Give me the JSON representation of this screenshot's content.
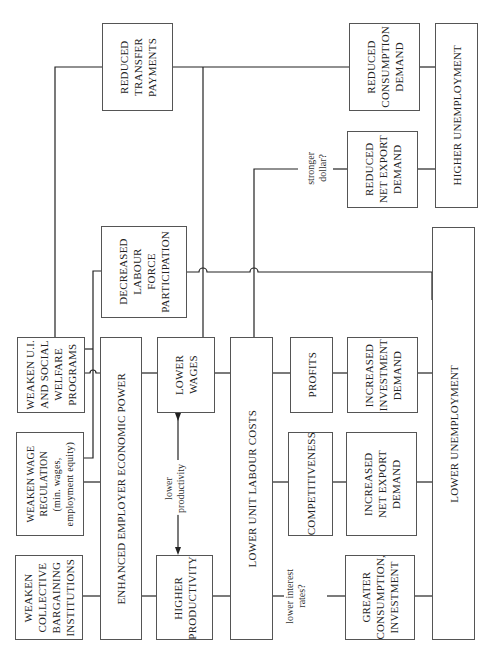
{
  "diagram": {
    "orientation": "rotated-90-ccw",
    "nodes": {
      "weaken_ui": {
        "label": "WEAKEN U.I.\nAND SOCIAL\nWELFARE\nPROGRAMS"
      },
      "weaken_wage_reg": {
        "label": "WEAKEN WAGE\nREGULATION\n(min. wages,\nemployment equity)"
      },
      "weaken_collective": {
        "label": "WEAKEN\nCOLLECTIVE\nBARGAINING\nINSTITUTIONS"
      },
      "enhanced_employer": {
        "label": "ENHANCED EMPLOYER ECONOMIC POWER"
      },
      "lower_wages": {
        "label": "LOWER\nWAGES"
      },
      "higher_productivity": {
        "label": "HIGHER\nPRODUCTIVITY"
      },
      "lower_unit_labour": {
        "label": "LOWER UNIT LABOUR COSTS"
      },
      "profits": {
        "label": "PROFITS"
      },
      "competitiveness": {
        "label": "COMPETITIVENESS"
      },
      "increased_investment": {
        "label": "INCREASED\nINVESTMENT\nDEMAND"
      },
      "increased_net_export": {
        "label": "INCREASED\nNET EXPORT\nDEMAND"
      },
      "greater_consumption": {
        "label": "GREATER\nCONSUMPTION,\nINVESTMENT"
      },
      "lower_unemployment": {
        "label": "LOWER UNEMPLOYMENT"
      },
      "decreased_lfp": {
        "label": "DECREASED\nLABOUR\nFORCE\nPARTICIPATION"
      },
      "reduced_transfer": {
        "label": "REDUCED\nTRANSFER\nPAYMENTS"
      },
      "reduced_net_export": {
        "label": "REDUCED\nNET EXPORT\nDEMAND"
      },
      "reduced_consumption": {
        "label": "REDUCED\nCONSUMPTION\nDEMAND"
      },
      "higher_unemployment": {
        "label": "HIGHER UNEMPLOYMENT"
      }
    },
    "annotations": {
      "lower_productivity": "lower\nproductivity",
      "lower_interest_rates": "lower interest\nrates?",
      "stronger_dollar": "stronger\ndollar?"
    },
    "edges": [
      [
        "weaken_ui",
        "enhanced_employer"
      ],
      [
        "weaken_ui",
        "decreased_lfp"
      ],
      [
        "weaken_ui",
        "reduced_transfer"
      ],
      [
        "weaken_wage_reg",
        "enhanced_employer"
      ],
      [
        "weaken_wage_reg",
        "decreased_lfp"
      ],
      [
        "weaken_collective",
        "enhanced_employer"
      ],
      [
        "enhanced_employer",
        "lower_wages"
      ],
      [
        "enhanced_employer",
        "higher_productivity"
      ],
      [
        "lower_wages",
        "higher_productivity",
        "lower productivity"
      ],
      [
        "lower_wages",
        "lower_unit_labour"
      ],
      [
        "lower_wages",
        "reduced_consumption"
      ],
      [
        "higher_productivity",
        "lower_unit_labour"
      ],
      [
        "lower_unit_labour",
        "profits"
      ],
      [
        "lower_unit_labour",
        "competitiveness"
      ],
      [
        "lower_unit_labour",
        "greater_consumption",
        "lower interest rates?"
      ],
      [
        "lower_unit_labour",
        "reduced_net_export",
        "stronger dollar?"
      ],
      [
        "profits",
        "increased_investment"
      ],
      [
        "competitiveness",
        "increased_net_export"
      ],
      [
        "increased_investment",
        "lower_unemployment"
      ],
      [
        "increased_net_export",
        "lower_unemployment"
      ],
      [
        "greater_consumption",
        "lower_unemployment"
      ],
      [
        "decreased_lfp",
        "lower_unemployment"
      ],
      [
        "reduced_transfer",
        "reduced_consumption"
      ],
      [
        "reduced_consumption",
        "higher_unemployment"
      ],
      [
        "reduced_net_export",
        "higher_unemployment"
      ]
    ]
  }
}
